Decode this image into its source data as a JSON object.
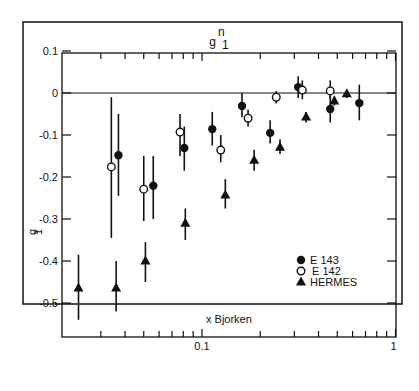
{
  "chart_data": {
    "type": "scatter",
    "title_main": "g",
    "title_sup": "n",
    "title_sub": "1",
    "xlabel": "x  Bjorken",
    "ylabel": "g",
    "ylabel_sub": "1",
    "xscale": "log",
    "xlim": [
      0.019,
      1.0
    ],
    "ylim": [
      -0.57,
      0.1
    ],
    "xticks_labeled": [
      {
        "value": 0.1,
        "label": "0.1"
      },
      {
        "value": 1,
        "label": "1"
      }
    ],
    "xticks_minor": [
      0.03,
      0.04,
      0.05,
      0.06,
      0.07,
      0.08,
      0.09,
      0.2,
      0.3,
      0.4,
      0.5,
      0.6,
      0.7,
      0.8,
      0.9
    ],
    "yticks": [
      {
        "value": 0.1,
        "label": "0.1"
      },
      {
        "value": 0,
        "label": "0"
      },
      {
        "value": -0.1,
        "label": "-0.1"
      },
      {
        "value": -0.2,
        "label": "-0.2"
      },
      {
        "value": -0.3,
        "label": "-0.3"
      },
      {
        "value": -0.4,
        "label": "-0.4"
      },
      {
        "value": -0.5,
        "label": "-0.5"
      }
    ],
    "zero_line": true,
    "grid": false,
    "legend_position": "lower right inside",
    "series": [
      {
        "name": "E 143",
        "marker": "filled-circle",
        "points": [
          {
            "x": 0.037,
            "y": -0.148,
            "lo": -0.245,
            "hi": -0.05
          },
          {
            "x": 0.056,
            "y": -0.221,
            "lo": -0.3,
            "hi": -0.15
          },
          {
            "x": 0.081,
            "y": -0.131,
            "lo": -0.185,
            "hi": -0.08
          },
          {
            "x": 0.113,
            "y": -0.086,
            "lo": -0.125,
            "hi": -0.045
          },
          {
            "x": 0.161,
            "y": -0.031,
            "lo": -0.058,
            "hi": 0.0
          },
          {
            "x": 0.225,
            "y": -0.095,
            "lo": -0.12,
            "hi": -0.065
          },
          {
            "x": 0.314,
            "y": 0.014,
            "lo": -0.012,
            "hi": 0.04
          },
          {
            "x": 0.46,
            "y": -0.038,
            "lo": -0.07,
            "hi": 0.0
          },
          {
            "x": 0.65,
            "y": -0.024,
            "lo": -0.065,
            "hi": 0.02
          }
        ]
      },
      {
        "name": "E 142",
        "marker": "open-circle",
        "points": [
          {
            "x": 0.034,
            "y": -0.176,
            "lo": -0.345,
            "hi": -0.01
          },
          {
            "x": 0.05,
            "y": -0.229,
            "lo": -0.305,
            "hi": -0.15
          },
          {
            "x": 0.077,
            "y": -0.093,
            "lo": -0.15,
            "hi": -0.05
          },
          {
            "x": 0.125,
            "y": -0.136,
            "lo": -0.165,
            "hi": -0.1
          },
          {
            "x": 0.173,
            "y": -0.06,
            "lo": -0.08,
            "hi": -0.04
          },
          {
            "x": 0.242,
            "y": -0.01,
            "lo": -0.025,
            "hi": 0.005
          },
          {
            "x": 0.33,
            "y": 0.007,
            "lo": -0.015,
            "hi": 0.03
          },
          {
            "x": 0.46,
            "y": 0.005,
            "lo": -0.015,
            "hi": 0.03
          }
        ]
      },
      {
        "name": "HERMES",
        "marker": "filled-triangle",
        "points": [
          {
            "x": 0.023,
            "y": -0.464,
            "lo": -0.54,
            "hi": -0.385
          },
          {
            "x": 0.036,
            "y": -0.464,
            "lo": -0.52,
            "hi": -0.4
          },
          {
            "x": 0.051,
            "y": -0.4,
            "lo": -0.45,
            "hi": -0.355
          },
          {
            "x": 0.082,
            "y": -0.31,
            "lo": -0.35,
            "hi": -0.275
          },
          {
            "x": 0.132,
            "y": -0.243,
            "lo": -0.275,
            "hi": -0.205
          },
          {
            "x": 0.186,
            "y": -0.16,
            "lo": -0.185,
            "hi": -0.135
          },
          {
            "x": 0.253,
            "y": -0.129,
            "lo": -0.145,
            "hi": -0.11
          },
          {
            "x": 0.345,
            "y": -0.057,
            "lo": -0.07,
            "hi": -0.045
          },
          {
            "x": 0.483,
            "y": -0.019,
            "lo": -0.03,
            "hi": -0.008
          },
          {
            "x": 0.56,
            "y": -0.002,
            "lo": -0.012,
            "hi": 0.008
          }
        ]
      }
    ]
  },
  "legend": {
    "items": [
      {
        "label": "E 143",
        "marker": "filled-circle"
      },
      {
        "label": "E 142",
        "marker": "open-circle"
      },
      {
        "label": "HERMES",
        "marker": "filled-triangle"
      }
    ]
  }
}
